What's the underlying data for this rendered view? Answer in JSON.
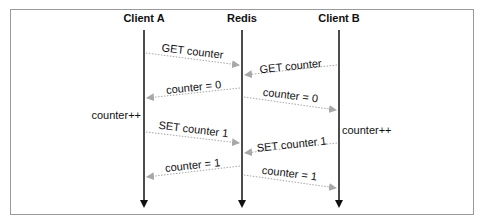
{
  "diagram": {
    "type": "sequence",
    "participants": [
      {
        "name": "Client A",
        "x": 144
      },
      {
        "name": "Redis",
        "x": 242
      },
      {
        "name": "Client B",
        "x": 339
      }
    ],
    "messages": [
      {
        "from": "Client A",
        "to": "Redis",
        "label": "GET counter"
      },
      {
        "from": "Client B",
        "to": "Redis",
        "label": "GET counter"
      },
      {
        "from": "Redis",
        "to": "Client A",
        "label": "counter = 0"
      },
      {
        "from": "Redis",
        "to": "Client B",
        "label": "counter = 0"
      },
      {
        "from": "Client A",
        "to": "Redis",
        "label": "SET counter 1"
      },
      {
        "from": "Client B",
        "to": "Redis",
        "label": "SET counter 1"
      },
      {
        "from": "Redis",
        "to": "Client A",
        "label": "counter = 1"
      },
      {
        "from": "Redis",
        "to": "Client B",
        "label": "counter = 1"
      }
    ],
    "notes": [
      {
        "participant": "Client A",
        "side": "left",
        "label": "counter++"
      },
      {
        "participant": "Client B",
        "side": "right",
        "label": "counter++"
      }
    ],
    "colors": {
      "lifeline": "#111111",
      "message_arrow": "#a8a8a8",
      "frame_border": "#9a9a9a"
    }
  }
}
